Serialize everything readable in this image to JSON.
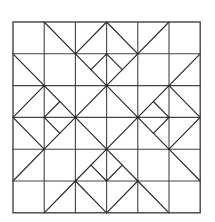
{
  "diagram": {
    "grid": {
      "columns": 6,
      "rows": 6,
      "origin": [
        13,
        22
      ],
      "cell_width": 31.2,
      "cell_height": 31.8
    },
    "stroke_color": "#222222",
    "border_color": "#444444",
    "background": "#ffffff",
    "segments": [
      [
        1,
        0,
        2,
        1
      ],
      [
        2,
        1,
        3,
        0
      ],
      [
        3,
        0,
        4,
        1
      ],
      [
        4,
        1,
        5,
        0
      ],
      [
        2,
        1,
        3,
        2
      ],
      [
        3,
        2,
        4,
        1
      ],
      [
        3,
        1,
        2.5,
        1.5
      ],
      [
        3,
        1,
        3.5,
        1.5
      ],
      [
        0,
        1,
        1,
        2
      ],
      [
        1,
        2,
        0,
        3
      ],
      [
        0,
        3,
        1,
        4
      ],
      [
        1,
        4,
        0,
        5
      ],
      [
        1,
        2,
        2,
        3
      ],
      [
        2,
        3,
        1,
        4
      ],
      [
        1,
        3,
        1.5,
        2.5
      ],
      [
        1,
        3,
        1.5,
        3.5
      ],
      [
        6,
        1,
        5,
        2
      ],
      [
        5,
        2,
        6,
        3
      ],
      [
        6,
        3,
        5,
        4
      ],
      [
        5,
        4,
        6,
        5
      ],
      [
        5,
        2,
        4,
        3
      ],
      [
        4,
        3,
        5,
        4
      ],
      [
        5,
        3,
        4.5,
        2.5
      ],
      [
        5,
        3,
        4.5,
        3.5
      ],
      [
        1,
        6,
        2,
        5
      ],
      [
        2,
        5,
        3,
        6
      ],
      [
        3,
        6,
        4,
        5
      ],
      [
        4,
        5,
        5,
        6
      ],
      [
        2,
        5,
        3,
        4
      ],
      [
        3,
        4,
        4,
        5
      ],
      [
        3,
        5,
        2.5,
        4.5
      ],
      [
        3,
        5,
        3.5,
        4.5
      ],
      [
        3,
        2,
        4,
        3
      ],
      [
        4,
        3,
        3,
        4
      ],
      [
        3,
        4,
        2,
        3
      ],
      [
        2,
        3,
        3,
        2
      ]
    ]
  }
}
